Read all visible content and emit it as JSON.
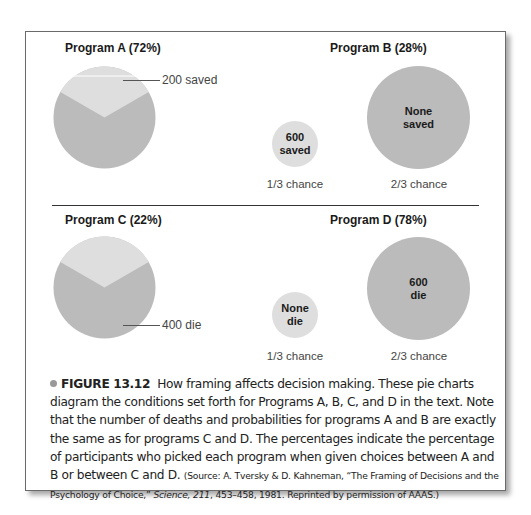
{
  "figure": {
    "program_a": {
      "title": "Program A (72%)",
      "callout": "200 saved"
    },
    "program_b": {
      "title": "Program B (28%)",
      "small_circle_line1": "600",
      "small_circle_line2": "saved",
      "large_circle_line1": "None",
      "large_circle_line2": "saved",
      "small_chance": "1/3 chance",
      "large_chance": "2/3 chance"
    },
    "program_c": {
      "title": "Program C (22%)",
      "callout": "400 die"
    },
    "program_d": {
      "title": "Program D (78%)",
      "small_circle_line1": "None",
      "small_circle_line2": "die",
      "large_circle_line1": "600",
      "large_circle_line2": "die",
      "small_chance": "1/3 chance",
      "large_chance": "2/3 chance"
    },
    "colors": {
      "dark_gray": "#bbbbbb",
      "light_gray": "#dedede"
    }
  },
  "caption": {
    "label": "FIGURE 13.12",
    "body": "How framing affects decision making. These pie charts diagram the conditions set forth for Programs A, B, C, and D in the text. Note that the number of deaths and probabilities for programs A and B are exactly the same as for programs C and D. The percentages indicate the percentage of participants who picked each program when given choices between A and B or between C and D.",
    "source_prefix": "(Source: A. Tversky & D. Kahneman, “The Framing of Decisions and the Psychology of Choice,”",
    "source_journal": "Science, 211",
    "source_suffix": ", 453–458, 1981. Reprinted by permission of AAAS.)"
  }
}
